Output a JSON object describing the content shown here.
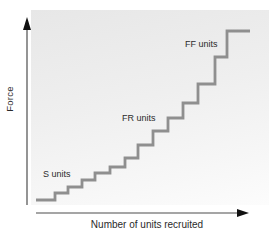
{
  "chart_data": {
    "type": "line",
    "subtype": "staircase",
    "title": "",
    "xlabel": "Number of units recruited",
    "ylabel": "Force",
    "legend": "none",
    "grid": false,
    "ticks": "none",
    "units": [
      1,
      2,
      3,
      4,
      5,
      6,
      7,
      8,
      9,
      10,
      11,
      12,
      13,
      14
    ],
    "relative_force": [
      13,
      20,
      26,
      33,
      40,
      46,
      55,
      68,
      82,
      95,
      110,
      129,
      156,
      182
    ],
    "steps_px": [
      {
        "x": 36,
        "y": 200
      },
      {
        "x": 55,
        "y": 193
      },
      {
        "x": 68,
        "y": 187
      },
      {
        "x": 82,
        "y": 180
      },
      {
        "x": 95,
        "y": 173
      },
      {
        "x": 110,
        "y": 167
      },
      {
        "x": 125,
        "y": 158
      },
      {
        "x": 138,
        "y": 145
      },
      {
        "x": 153,
        "y": 131
      },
      {
        "x": 168,
        "y": 118
      },
      {
        "x": 183,
        "y": 103
      },
      {
        "x": 198,
        "y": 84
      },
      {
        "x": 215,
        "y": 57
      },
      {
        "x": 227,
        "y": 31
      }
    ],
    "x_end_px": 250,
    "annotations": [
      {
        "id": "s-units",
        "label": "S units",
        "left": 43,
        "top": 169
      },
      {
        "id": "fr-units",
        "label": "FR units",
        "left": 122,
        "top": 113
      },
      {
        "id": "ff-units",
        "label": "FF units",
        "left": 185,
        "top": 39
      }
    ],
    "layout_px": {
      "y_axis": {
        "x": 27,
        "y1": 30,
        "y2": 205,
        "arrow_tip_y": 17,
        "arrow_half_w": 4
      },
      "x_axis": {
        "y": 213,
        "x1": 36,
        "x2": 237,
        "arrow_tip_x": 249,
        "arrow_half_h": 4
      }
    },
    "colors": {
      "line": "#8f8f8f",
      "axis": "#4d4d4d",
      "arrow": "#111111",
      "text": "#2b2b2b",
      "panel_top": "#e7e7e7",
      "panel_bottom": "#fcfcfc"
    }
  }
}
